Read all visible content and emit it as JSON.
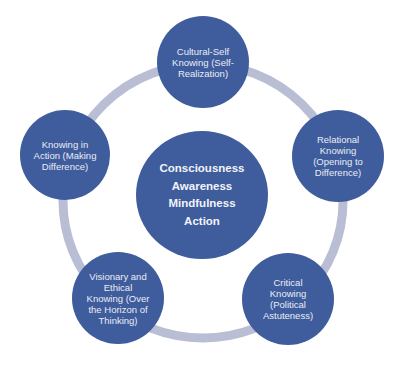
{
  "colors": {
    "node_fill": "#3f5c9c",
    "ring": "#b9bed4",
    "text": "#e9edf5",
    "background": "#ffffff"
  },
  "center": {
    "lines": [
      "Consciousness",
      "Awareness",
      "Mindfulness",
      "Action"
    ],
    "text": "Consciousness\nAwareness\nMindfulness\nAction"
  },
  "nodes": [
    {
      "id": "top",
      "text": "Cultural-Self\nKnowing (Self-\nRealization)"
    },
    {
      "id": "right",
      "text": "Relational\nKnowing\n(Opening to\nDifference)"
    },
    {
      "id": "bottom-right",
      "text": "Critical\nKnowing\n(Political\nAstuteness)"
    },
    {
      "id": "bottom-left",
      "text": "Visionary and\nEthical\nKnowing (Over\nthe Horizon of\nThinking)"
    },
    {
      "id": "left",
      "text": "Knowing in\nAction (Making\nDifference)"
    }
  ]
}
